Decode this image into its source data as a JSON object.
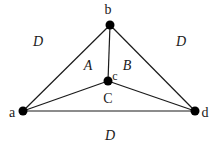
{
  "diagram": {
    "type": "planar-graph",
    "colors": {
      "edge": "#1a1a1a",
      "node": "#000000",
      "background": "#ffffff"
    },
    "nodes": [
      {
        "id": "a",
        "label": "a",
        "x": 23,
        "y": 111,
        "label_x": 12,
        "label_y": 117
      },
      {
        "id": "b",
        "label": "b",
        "x": 110,
        "y": 25,
        "label_x": 108,
        "label_y": 14
      },
      {
        "id": "c",
        "label": "c",
        "x": 108,
        "y": 81,
        "label_x": 115,
        "label_y": 80
      },
      {
        "id": "d",
        "label": "d",
        "x": 195,
        "y": 111,
        "label_x": 205,
        "label_y": 117
      }
    ],
    "edges": [
      {
        "from": "a",
        "to": "b"
      },
      {
        "from": "b",
        "to": "d"
      },
      {
        "from": "a",
        "to": "d"
      },
      {
        "from": "b",
        "to": "c"
      },
      {
        "from": "a",
        "to": "c"
      },
      {
        "from": "c",
        "to": "d"
      }
    ],
    "regions": [
      {
        "id": "A",
        "label": "A",
        "x": 88,
        "y": 70,
        "italic": true
      },
      {
        "id": "B",
        "label": "B",
        "x": 127,
        "y": 70,
        "italic": true
      },
      {
        "id": "C",
        "label": "C",
        "x": 108,
        "y": 103,
        "italic": false
      },
      {
        "id": "D-upper-left",
        "label": "D",
        "x": 38,
        "y": 46,
        "italic": true
      },
      {
        "id": "D-upper-right",
        "label": "D",
        "x": 181,
        "y": 46,
        "italic": true
      },
      {
        "id": "D-bottom",
        "label": "D",
        "x": 110,
        "y": 140,
        "italic": true
      }
    ]
  }
}
